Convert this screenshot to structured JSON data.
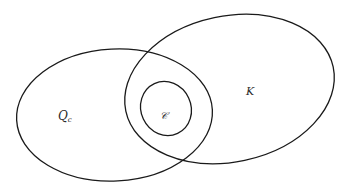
{
  "diagram": {
    "type": "venn / set inclusion diagram",
    "sets": [
      {
        "id": "Qc",
        "label_main": "Q",
        "label_sub": "c",
        "shape": "ellipse",
        "cx": 114.5,
        "cy": 115,
        "rx": 98,
        "ry": 66,
        "rotation_deg": -3
      },
      {
        "id": "K",
        "label_main": "K",
        "shape": "ellipse",
        "cx": 229.5,
        "cy": 89,
        "rx": 106,
        "ry": 73,
        "rotation_deg": -12
      },
      {
        "id": "C",
        "label_main": "𝒞",
        "shape": "ellipse",
        "cx": 166,
        "cy": 108.5,
        "rx": 25,
        "ry": 27.5,
        "rotation_deg": -25
      }
    ],
    "relations": [
      "C is contained in the intersection of Qc and K"
    ],
    "stroke_color": "#1a1a1a",
    "background_color": "#ffffff"
  },
  "labels": {
    "q_main": "Q",
    "q_sub": "c",
    "k": "K",
    "c": "𝒞"
  }
}
